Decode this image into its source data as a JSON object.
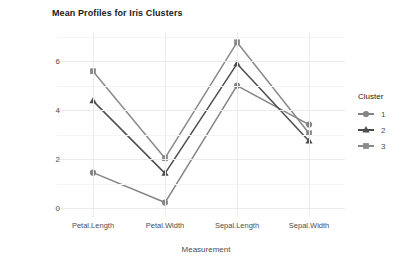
{
  "chart_data": {
    "type": "line",
    "title": "Mean Profiles for Iris Clusters",
    "xlabel": "Measurement",
    "ylabel": "Centimeters",
    "categories": [
      "Petal.Length",
      "Petal.Width",
      "Sepal.Length",
      "Sepal.Width"
    ],
    "ylim": [
      -0.35,
      7.2
    ],
    "yticks": [
      0,
      2,
      4,
      6
    ],
    "ytick_labels": [
      "0",
      "2",
      "4",
      "6"
    ],
    "grid": true,
    "legend_position": "right",
    "legend_title": "Cluster",
    "series": [
      {
        "name": "1",
        "label": "1",
        "marker": "circle",
        "color": "#848484",
        "values": [
          1.46,
          0.24,
          5.01,
          3.42
        ]
      },
      {
        "name": "2",
        "label": "2",
        "marker": "triangle",
        "color": "#4d4d4d",
        "values": [
          4.39,
          1.43,
          5.9,
          2.75
        ]
      },
      {
        "name": "3",
        "label": "3",
        "marker": "square",
        "color": "#8a8a8a",
        "values": [
          5.6,
          2.05,
          6.78,
          3.07
        ]
      }
    ]
  },
  "colors": {
    "panel_background": "#ffffff",
    "grid_major": "#ebebeb",
    "grid_minor": "#f4f4f4",
    "text": "#4d4d4d",
    "title_text": "#1a1a1a"
  }
}
